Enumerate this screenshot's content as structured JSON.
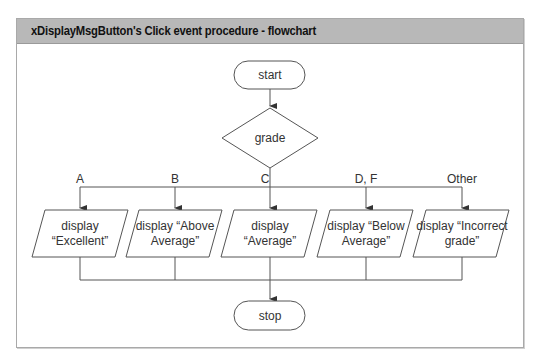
{
  "header": {
    "title": "xDisplayMsgButton's Click event procedure - flowchart"
  },
  "flowchart": {
    "start": {
      "label": "start"
    },
    "decision": {
      "label": "grade"
    },
    "branches": [
      {
        "condition": "A",
        "action_line1": "display",
        "action_line2": "“Excellent”"
      },
      {
        "condition": "B",
        "action_line1": "display “Above",
        "action_line2": "Average”"
      },
      {
        "condition": "C",
        "action_line1": "display",
        "action_line2": "“Average”"
      },
      {
        "condition": "D, F",
        "action_line1": "display “Below",
        "action_line2": "Average”"
      },
      {
        "condition": "Other",
        "action_line1": "display “Incorrect",
        "action_line2": "grade”"
      }
    ],
    "stop": {
      "label": "stop"
    }
  },
  "colors": {
    "header_bg": "#b8b8b8",
    "line": "#555555",
    "text": "#333333"
  }
}
